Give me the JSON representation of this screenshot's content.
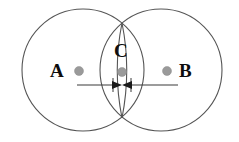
{
  "figure": {
    "background_color": "#ffffff",
    "width": 239,
    "height": 142
  },
  "labels": {
    "left_center": "A",
    "right_center": "B",
    "overlap": "C"
  },
  "colors": {
    "circle_stroke": "#555555",
    "dot_fill": "#9a9a9a",
    "label_text": "#0d0d0d",
    "dimension_line": "#3a3a3a",
    "arrow_fill": "#1a1a1a"
  },
  "geometry": {
    "circle_left": {
      "cx": 83,
      "cy": 70,
      "r": 61
    },
    "circle_right": {
      "cx": 161,
      "cy": 70,
      "r": 61
    },
    "lens_left_edge_x": 113,
    "lens_right_edge_x": 131,
    "intersection_top": {
      "x": 122,
      "y": 23
    },
    "intersection_bottom": {
      "x": 122,
      "y": 118
    },
    "dot_a": {
      "cx": 79,
      "cy": 71,
      "r": 4.5
    },
    "dot_b": {
      "cx": 167,
      "cy": 71,
      "r": 4.5
    },
    "dot_c": {
      "cx": 122,
      "cy": 72,
      "r": 4.5
    },
    "dimension_line": {
      "x1": 77,
      "x2": 178,
      "y": 85
    },
    "arrow_left_tip_x": 122,
    "arrow_right_tip_x": 122
  },
  "icons": {
    "left_arrow": "arrow-right-icon",
    "right_arrow": "arrow-left-icon"
  }
}
